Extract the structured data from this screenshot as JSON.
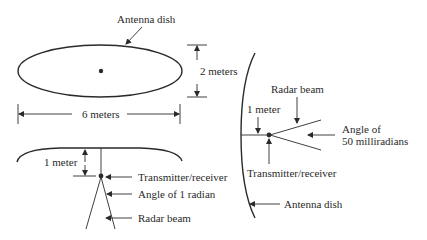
{
  "diagram": {
    "top_view": {
      "dish_label": "Antenna dish",
      "height_label": "2 meters",
      "width_label": "6 meters"
    },
    "side_view_left": {
      "distance_label": "1 meter",
      "transmitter_label": "Transmitter/receiver",
      "angle_label": "Angle of 1 radian",
      "beam_label": "Radar beam"
    },
    "side_view_right": {
      "beam_label": "Radar beam",
      "distance_label": "1 meter",
      "angle_label_line1": "Angle of",
      "angle_label_line2": "50 milliradians",
      "transmitter_label": "Transmitter/receiver",
      "dish_label": "Antenna dish"
    },
    "colors": {
      "ink": "#2a2a2a",
      "background": "#ffffff"
    }
  }
}
